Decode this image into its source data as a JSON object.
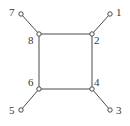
{
  "figure": {
    "kind": "box-graph",
    "background_color": "#ffffff",
    "line_color": "#4a4a4a",
    "label_color": "#3a3a3a",
    "node_fill": "#ffffff",
    "node_stroke": "#4a4a4a",
    "line_width": 1,
    "node_radius": 2.2,
    "width": 130,
    "height": 126
  },
  "chart_data": {
    "type": "diagram",
    "title": "",
    "nodes": [
      {
        "id": "1",
        "label": "1",
        "x": 110,
        "y": 14,
        "role": "external",
        "label_x": 116,
        "label_y": 7
      },
      {
        "id": "2",
        "label": "2",
        "x": 92,
        "y": 34,
        "role": "corner",
        "label_x": 94,
        "label_y": 35
      },
      {
        "id": "3",
        "label": "3",
        "x": 110,
        "y": 110,
        "role": "external",
        "label_x": 116,
        "label_y": 105
      },
      {
        "id": "4",
        "label": "4",
        "x": 92,
        "y": 89,
        "role": "corner",
        "label_x": 94,
        "label_y": 77
      },
      {
        "id": "5",
        "label": "5",
        "x": 21,
        "y": 110,
        "role": "external",
        "label_x": 9,
        "label_y": 105
      },
      {
        "id": "6",
        "label": "6",
        "x": 39,
        "y": 89,
        "role": "corner",
        "label_x": 28,
        "label_y": 77
      },
      {
        "id": "7",
        "label": "7",
        "x": 21,
        "y": 14,
        "role": "external",
        "label_x": 9,
        "label_y": 7
      },
      {
        "id": "8",
        "label": "8",
        "x": 39,
        "y": 34,
        "role": "corner",
        "label_x": 28,
        "label_y": 35
      }
    ],
    "edges": [
      {
        "from": "8",
        "to": "2",
        "kind": "box-side"
      },
      {
        "from": "2",
        "to": "4",
        "kind": "box-side"
      },
      {
        "from": "4",
        "to": "6",
        "kind": "box-side"
      },
      {
        "from": "6",
        "to": "8",
        "kind": "box-side"
      },
      {
        "from": "7",
        "to": "8",
        "kind": "external-leg"
      },
      {
        "from": "1",
        "to": "2",
        "kind": "external-leg"
      },
      {
        "from": "3",
        "to": "4",
        "kind": "external-leg"
      },
      {
        "from": "5",
        "to": "6",
        "kind": "external-leg"
      }
    ]
  }
}
